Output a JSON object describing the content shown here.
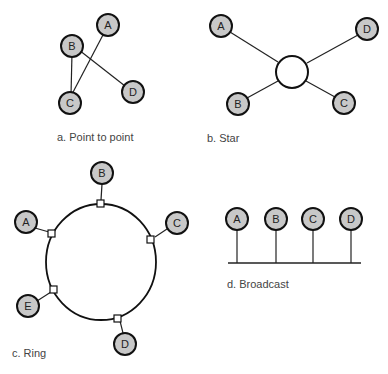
{
  "figure": {
    "panels": [
      {
        "id": "a",
        "caption": "a. Point to point",
        "nodes": [
          {
            "label": "A",
            "x": 108,
            "y": 25
          },
          {
            "label": "B",
            "x": 72,
            "y": 46
          },
          {
            "label": "C",
            "x": 70,
            "y": 103
          },
          {
            "label": "D",
            "x": 133,
            "y": 92
          }
        ],
        "edges": [
          [
            "A",
            "C"
          ],
          [
            "B",
            "C"
          ],
          [
            "B",
            "D"
          ]
        ]
      },
      {
        "id": "b",
        "caption": "b. Star",
        "hub": {
          "x": 292,
          "y": 72,
          "r": 16
        },
        "nodes": [
          {
            "label": "A",
            "x": 221,
            "y": 26
          },
          {
            "label": "D",
            "x": 367,
            "y": 29
          },
          {
            "label": "B",
            "x": 238,
            "y": 104
          },
          {
            "label": "C",
            "x": 344,
            "y": 103
          }
        ]
      },
      {
        "id": "c",
        "caption": "c. Ring",
        "ring": {
          "cx": 101,
          "cy": 262,
          "rx": 55,
          "ry": 58
        },
        "nodes": [
          {
            "label": "B",
            "x": 102,
            "y": 173
          },
          {
            "label": "A",
            "x": 26,
            "y": 222
          },
          {
            "label": "C",
            "x": 177,
            "y": 223
          },
          {
            "label": "E",
            "x": 28,
            "y": 306
          },
          {
            "label": "D",
            "x": 125,
            "y": 344
          }
        ]
      },
      {
        "id": "d",
        "caption": "d. Broadcast",
        "bus": {
          "x1": 228,
          "x2": 361,
          "y": 263
        },
        "nodes": [
          {
            "label": "A",
            "x": 237,
            "y": 219
          },
          {
            "label": "B",
            "x": 276,
            "y": 219
          },
          {
            "label": "C",
            "x": 313,
            "y": 219
          },
          {
            "label": "D",
            "x": 351,
            "y": 219
          }
        ]
      }
    ],
    "colors": {
      "node_fill": "#c8c8c8",
      "stroke": "#111111",
      "caption": "#444444"
    }
  }
}
